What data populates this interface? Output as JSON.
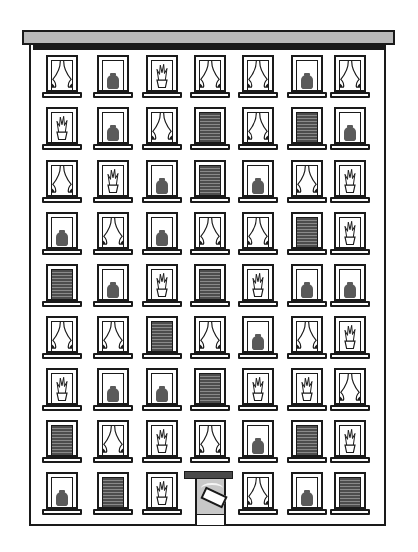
{
  "scene": {
    "subject": "apartment building facade illustration",
    "colors": {
      "outline": "#1a1a1a",
      "roof": "#b9b9b9",
      "blind": "#4d4d4d",
      "vase": "#5a5a5a",
      "door": "#c8c8c8",
      "background": "#ffffff"
    },
    "columns_x": [
      44,
      95,
      144,
      192,
      240,
      289,
      332
    ],
    "rows_y": [
      55,
      107,
      160,
      212,
      264,
      316,
      368,
      420,
      472
    ],
    "windows": [
      [
        "curtain",
        "vase",
        "plant",
        "curtain",
        "curtain",
        "vase",
        "curtain"
      ],
      [
        "plant",
        "vase",
        "curtain",
        "blind",
        "curtain",
        "blind",
        "vase"
      ],
      [
        "curtain",
        "plant",
        "vase",
        "blind",
        "vase",
        "curtain",
        "plant"
      ],
      [
        "vase",
        "curtain",
        "vase",
        "curtain",
        "curtain",
        "blind",
        "plant"
      ],
      [
        "blind",
        "vase",
        "plant",
        "blind",
        "plant",
        "vase",
        "vase"
      ],
      [
        "curtain",
        "curtain",
        "blind",
        "curtain",
        "vase",
        "curtain",
        "plant"
      ],
      [
        "plant",
        "vase",
        "vase",
        "blind",
        "plant",
        "plant",
        "curtain"
      ],
      [
        "blind",
        "curtain",
        "plant",
        "curtain",
        "vase",
        "blind",
        "plant"
      ],
      [
        "vase",
        "blind",
        "plant",
        "door",
        "curtain",
        "vase",
        "blind"
      ]
    ]
  }
}
